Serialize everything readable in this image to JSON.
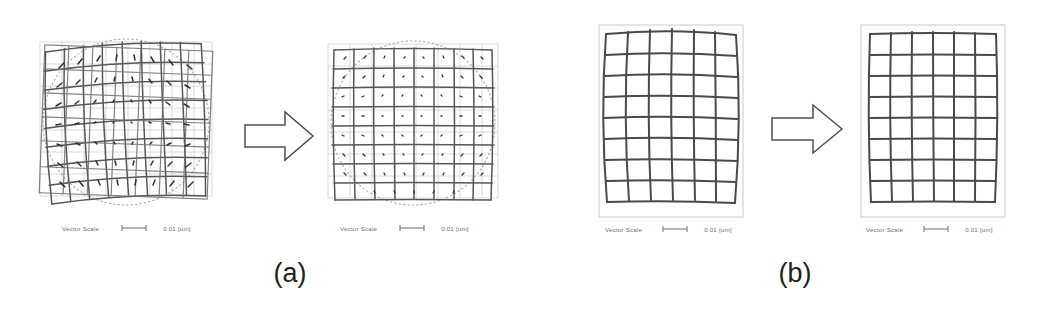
{
  "figure": {
    "background": "#ffffff",
    "ink_dark": "#4a4a4a",
    "ink_light": "#b9b9b9",
    "caption_color": "#231f20"
  },
  "panels": [
    {
      "id": "a-before",
      "name": "overlay-misaligned-wafer-map",
      "group": "a",
      "state": "before",
      "kind": "wafer-vector-map",
      "grid_cols": 9,
      "grid_rows": 9,
      "has_wafer_circle": true,
      "has_reference_grid": true,
      "distorted": true,
      "scale": {
        "label": "Vector Scale",
        "bar_glyph": "bar-marker",
        "value": "0.01 [um]"
      }
    },
    {
      "id": "a-after",
      "name": "overlay-corrected-wafer-map",
      "group": "a",
      "state": "after",
      "kind": "wafer-vector-map",
      "grid_cols": 9,
      "grid_rows": 9,
      "has_wafer_circle": true,
      "has_reference_grid": true,
      "distorted": false,
      "scale": {
        "label": "Vector Scale",
        "bar_glyph": "bar-marker",
        "value": "0.01 [um]"
      }
    },
    {
      "id": "b-before",
      "name": "distortion-grid-before",
      "group": "b",
      "state": "before",
      "kind": "distortion-grid",
      "grid_cols": 6,
      "grid_rows": 9,
      "has_wafer_circle": false,
      "has_reference_grid": false,
      "distorted": true,
      "scale": {
        "label": "Vector Scale",
        "bar_glyph": "bar-marker",
        "value": "0.01 [um]"
      }
    },
    {
      "id": "b-after",
      "name": "distortion-grid-after",
      "group": "b",
      "state": "after",
      "kind": "distortion-grid",
      "grid_cols": 6,
      "grid_rows": 9,
      "has_wafer_circle": false,
      "has_reference_grid": false,
      "distorted": false,
      "scale": {
        "label": "Vector Scale",
        "bar_glyph": "bar-marker",
        "value": "0.01 [um]"
      }
    }
  ],
  "arrows": [
    {
      "id": "arrow-a",
      "name": "transform-arrow-a",
      "direction": "right"
    },
    {
      "id": "arrow-b",
      "name": "transform-arrow-b",
      "direction": "right"
    }
  ],
  "captions": {
    "a": "(a)",
    "b": "(b)"
  }
}
